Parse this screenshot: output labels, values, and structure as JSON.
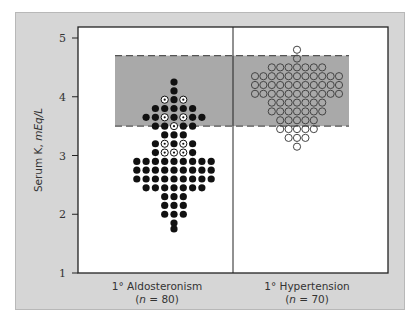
{
  "chart_data": {
    "type": "scatter",
    "title": "",
    "xlabel": "",
    "ylabel": "Serum K, mEq/L",
    "ylabel_parts": {
      "plain": "Serum K, ",
      "italic": "mEq/L"
    },
    "ylim": [
      1,
      5
    ],
    "yticks": [
      1,
      2,
      3,
      4,
      5
    ],
    "grid": false,
    "reference_band": {
      "low": 3.5,
      "high": 4.7,
      "label": "normal range",
      "color": "#a9a9a9"
    },
    "categories": [
      {
        "label": "1° Aldosteronism",
        "n_label": "n = 80",
        "n": 80,
        "marker": "filled (some with dot-in-circle)"
      },
      {
        "label": "1° Hypertension",
        "n_label": "n = 70",
        "n": 70,
        "marker": "open circle"
      }
    ],
    "series": [
      {
        "name": "1° Aldosteronism",
        "rows": [
          {
            "k": 4.25,
            "pattern": "F"
          },
          {
            "k": 4.1,
            "pattern": "F"
          },
          {
            "k": 3.95,
            "pattern": "OFO"
          },
          {
            "k": 3.8,
            "pattern": "FFFFF"
          },
          {
            "k": 3.65,
            "pattern": "FFOFOFF"
          },
          {
            "k": 3.5,
            "pattern": "FFOFF"
          },
          {
            "k": 3.35,
            "pattern": "FFF"
          },
          {
            "k": 3.2,
            "pattern": "FOFOF"
          },
          {
            "k": 3.05,
            "pattern": "FOOOF"
          },
          {
            "k": 2.9,
            "pattern": "FFFFFFFFF"
          },
          {
            "k": 2.75,
            "pattern": "FFFFFFFFF"
          },
          {
            "k": 2.6,
            "pattern": "FFFFFFFFF"
          },
          {
            "k": 2.45,
            "pattern": "FFFFFFF"
          },
          {
            "k": 2.3,
            "pattern": "FFF"
          },
          {
            "k": 2.15,
            "pattern": "FFF"
          },
          {
            "k": 2.0,
            "pattern": "FFF"
          },
          {
            "k": 1.85,
            "pattern": "F"
          },
          {
            "k": 1.75,
            "pattern": "F"
          }
        ]
      },
      {
        "name": "1° Hypertension",
        "rows": [
          {
            "k": 4.8,
            "count": 1
          },
          {
            "k": 4.65,
            "count": 1
          },
          {
            "k": 4.5,
            "count": 7
          },
          {
            "k": 4.35,
            "count": 11
          },
          {
            "k": 4.2,
            "count": 11
          },
          {
            "k": 4.05,
            "count": 11
          },
          {
            "k": 3.9,
            "count": 7
          },
          {
            "k": 3.75,
            "count": 7
          },
          {
            "k": 3.6,
            "count": 5
          },
          {
            "k": 3.45,
            "count": 5
          },
          {
            "k": 3.3,
            "count": 3
          },
          {
            "k": 3.15,
            "count": 1
          }
        ]
      }
    ]
  },
  "labels": {
    "y_axis": "Serum K, mEq/L",
    "group1_name": "1° Aldosteronism",
    "group1_n": "(n = 80)",
    "group2_name": "1° Hypertension",
    "group2_n": "(n = 70)"
  }
}
